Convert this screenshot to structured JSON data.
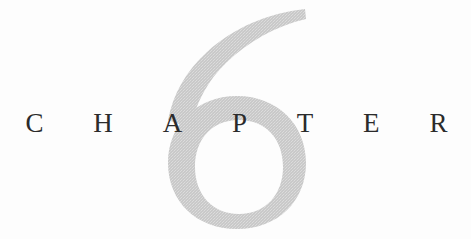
{
  "page": {
    "kind": "book-chapter-opener",
    "background_color": "#fdfdfd",
    "width": 471,
    "height": 239
  },
  "heading": {
    "word": "CHAPTER",
    "letters": [
      "C",
      "H",
      "A",
      "P",
      "T",
      "E",
      "R"
    ],
    "color": "#2b2b2b"
  },
  "numeral": {
    "value": "6",
    "label": "chapter-number-6",
    "color": "#c9c9c9",
    "counter_color": "#fdfdfd"
  }
}
